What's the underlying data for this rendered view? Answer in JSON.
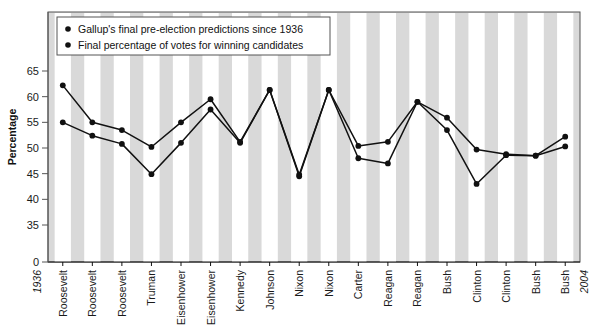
{
  "chart_data": {
    "type": "line",
    "title": "",
    "xlabel": "",
    "ylabel": "Percentage",
    "ylim": [
      0,
      68
    ],
    "yticks": [
      0,
      35,
      40,
      45,
      50,
      55,
      60,
      65
    ],
    "grid": false,
    "axis_break": true,
    "legend_position": "top-left",
    "x_start_label": "1936",
    "x_end_label": "2004",
    "categories": [
      "Roosevelt",
      "Roosevelt",
      "Roosevelt",
      "Truman",
      "Eisenhower",
      "Eisenhower",
      "Kennedy",
      "Johnson",
      "Nixon",
      "Nixon",
      "Carter",
      "Reagan",
      "Reagan",
      "Bush",
      "Clinton",
      "Clinton",
      "Bush",
      "Bush"
    ],
    "series": [
      {
        "name": "Gallup's final pre-election predictions since 1936",
        "marker": "circle",
        "values": [
          55.0,
          52.4,
          50.8,
          44.9,
          51.0,
          57.5,
          51.0,
          61.3,
          44.5,
          61.3,
          48.0,
          47.0,
          59.0,
          53.5,
          43.0,
          48.6,
          48.5,
          50.3
        ]
      },
      {
        "name": "Final percentage of votes for winning candidates",
        "marker": "circle",
        "values": [
          62.2,
          55.0,
          53.5,
          50.2,
          55.0,
          59.5,
          51.2,
          61.3,
          44.8,
          61.3,
          50.4,
          51.2,
          59.0,
          55.9,
          49.7,
          48.8,
          48.5,
          52.2
        ]
      }
    ],
    "legend": [
      "Gallup's final pre-election predictions since 1936",
      "Final percentage of votes for winning candidates"
    ],
    "colors": {
      "line": "#111111",
      "marker": "#111111",
      "plot_background": "#d9d9d9",
      "stripe": "#ffffff",
      "border": "#555555"
    }
  }
}
